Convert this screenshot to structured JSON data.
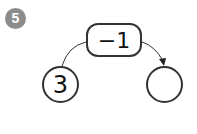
{
  "problem": {
    "number": "5",
    "operation": "−1",
    "start_value": "3",
    "answer_value": ""
  }
}
